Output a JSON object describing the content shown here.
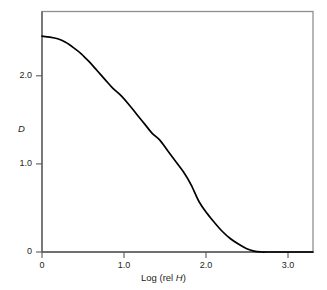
{
  "chart_data": {
    "type": "line",
    "title": "",
    "subtitle": "",
    "xlabel": "Log (rel H)",
    "xlabel_plain": "Log (rel ",
    "xlabel_italic": "H",
    "xlabel_tail": ")",
    "ylabel": "D",
    "xlim": [
      0,
      3.45
    ],
    "ylim": [
      0,
      2.72
    ],
    "xticks": [
      0,
      1.0,
      2.0,
      3.0
    ],
    "xtick_labels": [
      "0",
      "1.0",
      "2.0",
      "3.0"
    ],
    "yticks": [
      0,
      1.0,
      2.0
    ],
    "ytick_labels": [
      "0",
      "1.0",
      "2.0"
    ],
    "grid": false,
    "legend": false,
    "legend_position": "none",
    "series": [
      {
        "name": "characteristic curve",
        "color": "#000000",
        "x": [
          0.0,
          0.1,
          0.2,
          0.3,
          0.4,
          0.5,
          0.6,
          0.7,
          0.8,
          0.9,
          1.0,
          1.1,
          1.2,
          1.3,
          1.4,
          1.5,
          1.6,
          1.7,
          1.8,
          1.9,
          2.0,
          2.1,
          2.2,
          2.3,
          2.4,
          2.5,
          2.6,
          2.7,
          2.8,
          2.85,
          3.0,
          3.2,
          3.45
        ],
        "y": [
          2.45,
          2.44,
          2.42,
          2.38,
          2.32,
          2.25,
          2.16,
          2.06,
          1.96,
          1.86,
          1.78,
          1.68,
          1.57,
          1.46,
          1.35,
          1.27,
          1.15,
          1.03,
          0.91,
          0.76,
          0.57,
          0.44,
          0.33,
          0.23,
          0.15,
          0.09,
          0.04,
          0.01,
          0.0,
          0.0,
          0.0,
          0.0,
          0.0
        ]
      }
    ]
  },
  "axes": {
    "frame_color": "#8a8a8a",
    "axis_color": "#58595b",
    "curve_color": "#000000"
  }
}
